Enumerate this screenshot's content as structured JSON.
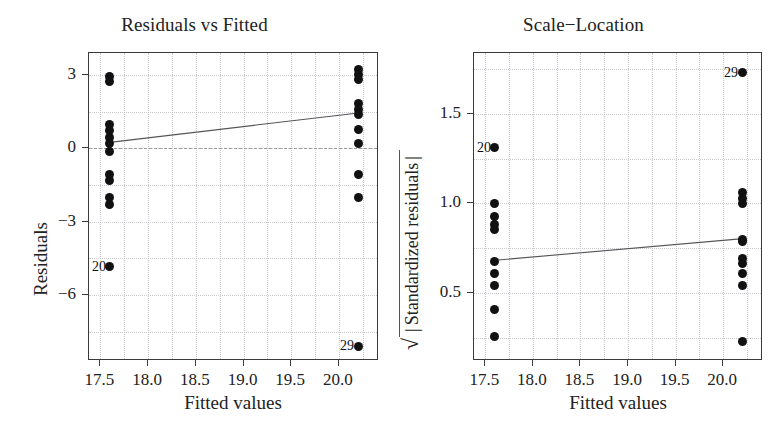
{
  "figure": {
    "width": 778,
    "height": 430,
    "background": "#ffffff",
    "point_color": "#111111",
    "grid_color": "#c9c9cf",
    "frame_color": "#3a3a3a",
    "trend_color": "#555555",
    "zero_line_color": "#9a9a9a"
  },
  "chart_data": [
    {
      "id": "residuals-vs-fitted",
      "type": "scatter",
      "title": "Residuals vs Fitted",
      "xlabel": "Fitted values",
      "ylabel": "Residuals",
      "xlim": [
        17.38,
        20.42
      ],
      "ylim": [
        -8.7,
        3.9
      ],
      "xticks": [
        17.5,
        18.0,
        18.5,
        19.0,
        19.5,
        20.0
      ],
      "xtick_labels": [
        "17.5",
        "18.0",
        "18.5",
        "19.0",
        "19.5",
        "20.0"
      ],
      "yticks": [
        3,
        0,
        -3,
        -6
      ],
      "ytick_labels": [
        "3",
        "0",
        "−3",
        "−6"
      ],
      "grid": true,
      "legend": "none",
      "zero_reference_line": 0,
      "trend_line": {
        "x0": 17.6,
        "y0": 0.22,
        "x1": 20.2,
        "y1": 1.42
      },
      "points": [
        {
          "x": 17.6,
          "y": 2.95
        },
        {
          "x": 17.6,
          "y": 2.72
        },
        {
          "x": 17.6,
          "y": 0.98
        },
        {
          "x": 17.6,
          "y": 0.72
        },
        {
          "x": 17.6,
          "y": 0.45
        },
        {
          "x": 17.6,
          "y": 0.2
        },
        {
          "x": 17.6,
          "y": -0.12
        },
        {
          "x": 17.6,
          "y": -1.05
        },
        {
          "x": 17.6,
          "y": -1.3
        },
        {
          "x": 17.6,
          "y": -2.0
        },
        {
          "x": 17.6,
          "y": -2.28
        },
        {
          "x": 17.6,
          "y": -4.85
        },
        {
          "x": 20.2,
          "y": 3.22
        },
        {
          "x": 20.2,
          "y": 3.02
        },
        {
          "x": 20.2,
          "y": 2.82
        },
        {
          "x": 20.2,
          "y": 1.85
        },
        {
          "x": 20.2,
          "y": 1.58
        },
        {
          "x": 20.2,
          "y": 1.38
        },
        {
          "x": 20.2,
          "y": 0.78
        },
        {
          "x": 20.2,
          "y": 0.18
        },
        {
          "x": 20.2,
          "y": -1.05
        },
        {
          "x": 20.2,
          "y": -2.0
        },
        {
          "x": 20.2,
          "y": -8.1
        }
      ],
      "annotations": [
        {
          "text": "20",
          "x": 17.6,
          "y": -4.85,
          "align": "left"
        },
        {
          "text": "29",
          "x": 20.2,
          "y": -8.1,
          "align": "left"
        }
      ]
    },
    {
      "id": "scale-location",
      "type": "scatter",
      "title": "Scale−Location",
      "xlabel": "Fitted values",
      "ylabel_prefix": "√",
      "ylabel": "Standardized residuals",
      "ylabel_full": "√| Standardized residuals |",
      "xlim": [
        17.38,
        20.42
      ],
      "ylim": [
        0.12,
        1.84
      ],
      "xticks": [
        17.5,
        18.0,
        18.5,
        19.0,
        19.5,
        20.0
      ],
      "xtick_labels": [
        "17.5",
        "18.0",
        "18.5",
        "19.0",
        "19.5",
        "20.0"
      ],
      "yticks": [
        1.5,
        1.0,
        0.5
      ],
      "ytick_labels": [
        "1.5",
        "1.0",
        "0.5"
      ],
      "grid": true,
      "legend": "none",
      "trend_line": {
        "x0": 17.6,
        "y0": 0.675,
        "x1": 20.2,
        "y1": 0.795
      },
      "points": [
        {
          "x": 17.6,
          "y": 1.31
        },
        {
          "x": 17.6,
          "y": 1.0
        },
        {
          "x": 17.6,
          "y": 0.925
        },
        {
          "x": 17.6,
          "y": 0.885
        },
        {
          "x": 17.6,
          "y": 0.855
        },
        {
          "x": 17.6,
          "y": 0.675
        },
        {
          "x": 17.6,
          "y": 0.61
        },
        {
          "x": 17.6,
          "y": 0.54
        },
        {
          "x": 17.6,
          "y": 0.405
        },
        {
          "x": 17.6,
          "y": 0.255
        },
        {
          "x": 20.2,
          "y": 1.73
        },
        {
          "x": 20.2,
          "y": 1.06
        },
        {
          "x": 20.2,
          "y": 1.03
        },
        {
          "x": 20.2,
          "y": 1.0
        },
        {
          "x": 20.2,
          "y": 0.8
        },
        {
          "x": 20.2,
          "y": 0.79
        },
        {
          "x": 20.2,
          "y": 0.69
        },
        {
          "x": 20.2,
          "y": 0.665
        },
        {
          "x": 20.2,
          "y": 0.61
        },
        {
          "x": 20.2,
          "y": 0.54
        },
        {
          "x": 20.2,
          "y": 0.23
        }
      ],
      "annotations": [
        {
          "text": "20",
          "x": 17.6,
          "y": 1.31,
          "align": "left"
        },
        {
          "text": "29",
          "x": 20.2,
          "y": 1.73,
          "align": "left"
        }
      ]
    }
  ]
}
